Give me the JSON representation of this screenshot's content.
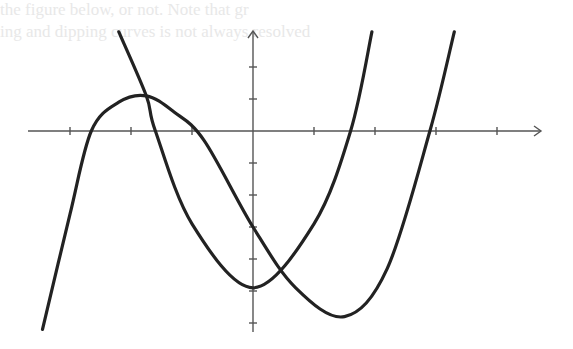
{
  "page": {
    "faint_background_lines": [
      "the figure below, or not. Note that gr",
      "ing and dipping curves is not always resolved",
      "following",
      "a functional relationship and curvature",
      "several"
    ]
  },
  "chart_data": {
    "type": "line",
    "title": "",
    "xlabel": "",
    "ylabel": "",
    "grid": false,
    "legend": null,
    "x_ticks": [
      -3,
      -2,
      -1,
      1,
      2,
      3,
      4
    ],
    "y_ticks": [
      2,
      1,
      -1,
      -2,
      -3,
      -4,
      -5,
      -6
    ],
    "xlim": [
      -3.7,
      4.7
    ],
    "ylim": [
      -6.3,
      3.1
    ],
    "series": [
      {
        "name": "cubic",
        "description": "Cubic curve rising from bottom-left, local max near (-1.75, 1.1), crossing y-axis near -3.0, local min near (1.5, -5.8), rising steeply to top-right",
        "x": [
          -3.45,
          -3.0,
          -2.65,
          -2.2,
          -1.75,
          -1.3,
          -0.8,
          0.0,
          0.7,
          1.5,
          2.2,
          2.9,
          3.3
        ],
        "y": [
          -6.2,
          -2.6,
          0.0,
          0.9,
          1.1,
          0.6,
          -0.3,
          -3.0,
          -4.9,
          -5.8,
          -4.3,
          0.0,
          3.1
        ]
      },
      {
        "name": "parabola",
        "description": "Upward parabola with vertex near (0, -4.9), x-intercepts near -1.6 and 1.6",
        "x": [
          -2.2,
          -1.75,
          -1.6,
          -1.0,
          0.0,
          1.0,
          1.6,
          1.95
        ],
        "y": [
          3.1,
          1.1,
          0.0,
          -2.9,
          -4.9,
          -2.9,
          0.0,
          3.1
        ]
      }
    ],
    "intersections": [
      {
        "x": -1.75,
        "y": 1.1
      },
      {
        "x": 0.45,
        "y": -4.4
      }
    ]
  }
}
